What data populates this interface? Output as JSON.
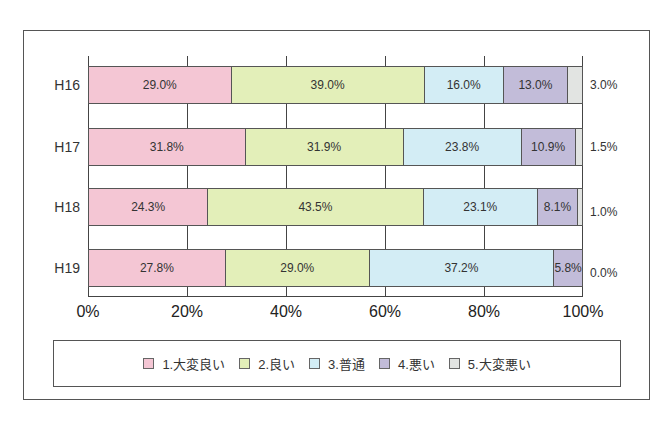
{
  "chart_data": {
    "type": "bar",
    "orientation": "horizontal",
    "stacked": "percent",
    "categories": [
      "H16",
      "H17",
      "H18",
      "H19"
    ],
    "series": [
      {
        "name": "1.大変良い",
        "color": "#f4c6d4",
        "values": [
          29.0,
          31.8,
          24.3,
          27.8
        ],
        "labels": [
          "29.0%",
          "31.8%",
          "24.3%",
          "27.8%"
        ]
      },
      {
        "name": "2.良い",
        "color": "#e3efb9",
        "values": [
          39.0,
          31.9,
          43.5,
          29.0
        ],
        "labels": [
          "39.0%",
          "31.9%",
          "43.5%",
          "29.0%"
        ]
      },
      {
        "name": "3.普通",
        "color": "#d3edf5",
        "values": [
          16.0,
          23.8,
          23.1,
          37.2
        ],
        "labels": [
          "16.0%",
          "23.8%",
          "23.1%",
          "37.2%"
        ]
      },
      {
        "name": "4.悪い",
        "color": "#c2bcd9",
        "values": [
          13.0,
          10.9,
          8.1,
          5.8
        ],
        "labels": [
          "13.0%",
          "10.9%",
          "8.1%",
          "5.8%"
        ]
      },
      {
        "name": "5.大変悪い",
        "color": "#e2e4e2",
        "values": [
          3.0,
          1.5,
          1.0,
          0.0
        ],
        "labels": [
          "3.0%",
          "1.5%",
          "1.0%",
          "0.0%"
        ]
      }
    ],
    "xticks": [
      "0%",
      "20%",
      "40%",
      "60%",
      "80%",
      "100%"
    ],
    "xlim": [
      0,
      100
    ],
    "title": "",
    "xlabel": "",
    "ylabel": "",
    "grid": true,
    "legend_position": "bottom"
  }
}
